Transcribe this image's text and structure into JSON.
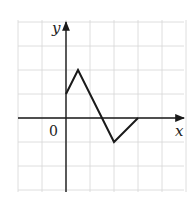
{
  "chart_data": {
    "type": "line",
    "title": "",
    "xlabel": "x",
    "ylabel": "y",
    "origin_label": "0",
    "grid": true,
    "xlim": [
      -2,
      4.5
    ],
    "ylim": [
      -3,
      3.5
    ],
    "x_tick_labels": [],
    "y_tick_labels": [],
    "series": [
      {
        "name": "f(x)",
        "points": [
          [
            0,
            1
          ],
          [
            0.5,
            2
          ],
          [
            2,
            -1
          ],
          [
            3,
            0
          ]
        ]
      }
    ],
    "colors": {
      "curve": "#1a1a1a",
      "grid": "#d6d6d6",
      "axis": "#1a1a1a"
    }
  }
}
